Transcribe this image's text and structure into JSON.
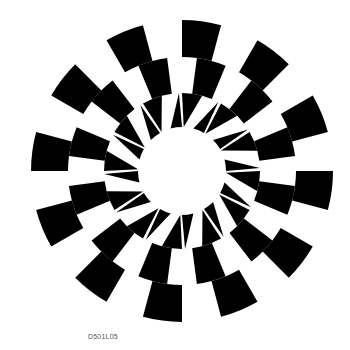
{
  "figure": {
    "caption": "D501L05",
    "center": [
      182,
      171
    ],
    "segments": 24,
    "twist_deg": 7.5,
    "colors": {
      "fg": "#000000",
      "bg": "#ffffff"
    },
    "rings": [
      {
        "name": "inner-spikes",
        "r0": 44,
        "r1": 78,
        "style": "spikes"
      },
      {
        "name": "middle-checker",
        "r0": 78,
        "r1": 114,
        "style": "checker",
        "offset": 0
      },
      {
        "name": "outer-checker",
        "r0": 114,
        "r1": 151,
        "style": "checker",
        "offset": 1
      }
    ]
  }
}
